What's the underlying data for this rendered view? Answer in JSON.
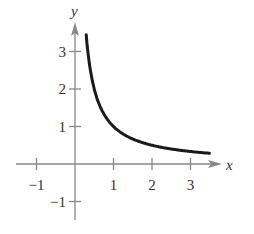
{
  "chart_data": {
    "type": "line",
    "title": "",
    "xlabel": "x",
    "ylabel": "y",
    "xlim": [
      -1.3,
      3.9
    ],
    "ylim": [
      -1.5,
      3.7
    ],
    "x_ticks": [
      "-1",
      "1",
      "2",
      "3"
    ],
    "y_ticks": [
      "-1",
      "1",
      "2",
      "3"
    ],
    "grid": false,
    "series": [
      {
        "name": "y = 1/x",
        "x": [
          0.29,
          0.35,
          0.4,
          0.5,
          0.6,
          0.75,
          1,
          1.25,
          1.5,
          2,
          2.5,
          3,
          3.5
        ],
        "values": [
          3.45,
          2.86,
          2.5,
          2.0,
          1.67,
          1.33,
          1.0,
          0.8,
          0.67,
          0.5,
          0.4,
          0.33,
          0.29
        ]
      }
    ]
  },
  "colors": {
    "axis": "#888888",
    "curve": "#1a1a1a",
    "text": "#333333"
  }
}
